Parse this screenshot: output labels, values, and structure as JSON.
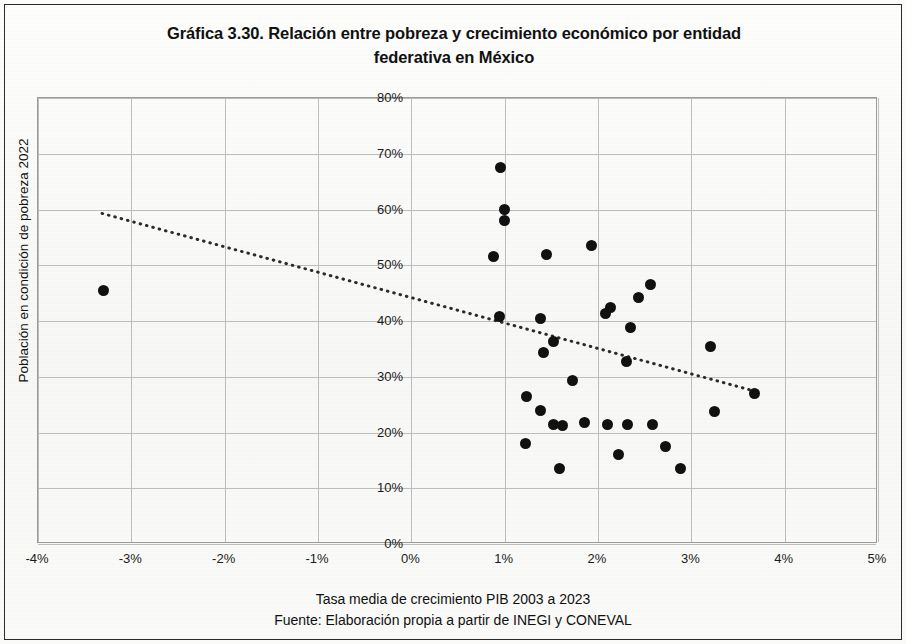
{
  "chart_data": {
    "type": "scatter",
    "title": "Gráfica 3.30. Relación entre pobreza y crecimiento económico por entidad federativa en México",
    "title_line1": "Gráfica 3.30. Relación entre pobreza y crecimiento económico por entidad",
    "title_line2": "federativa en México",
    "xlabel": "Tasa media de crecimiento PIB 2003 a 2023",
    "ylabel": "Población en condición de pobreza 2022",
    "source": "Fuente: Elaboración propia a partir de INEGI y CONEVAL",
    "xlim": [
      -4,
      5
    ],
    "ylim": [
      0,
      80
    ],
    "x_tick_step": 1,
    "y_tick_step": 10,
    "xticks": [
      "-4%",
      "-3%",
      "-2%",
      "-1%",
      "0%",
      "1%",
      "2%",
      "3%",
      "4%",
      "5%"
    ],
    "xtick_values": [
      -4,
      -3,
      -2,
      -1,
      0,
      1,
      2,
      3,
      4,
      5
    ],
    "yticks": [
      "0%",
      "10%",
      "20%",
      "30%",
      "40%",
      "50%",
      "60%",
      "70%",
      "80%"
    ],
    "ytick_values": [
      0,
      10,
      20,
      30,
      40,
      50,
      60,
      70,
      80
    ],
    "grid": true,
    "legend": false,
    "marker_color": "#111111",
    "grid_color": "#bdbdbd",
    "axis_color": "#9a9a9a",
    "marker_size_px": 11,
    "points": [
      {
        "x": -3.3,
        "y": 45.5
      },
      {
        "x": 0.95,
        "y": 67.5
      },
      {
        "x": 1.0,
        "y": 60.0
      },
      {
        "x": 1.0,
        "y": 58.0
      },
      {
        "x": 0.88,
        "y": 51.5
      },
      {
        "x": 1.45,
        "y": 52.0
      },
      {
        "x": 1.93,
        "y": 53.5
      },
      {
        "x": 0.94,
        "y": 40.8
      },
      {
        "x": 1.38,
        "y": 40.5
      },
      {
        "x": 2.08,
        "y": 41.3
      },
      {
        "x": 2.13,
        "y": 42.5
      },
      {
        "x": 2.56,
        "y": 46.5
      },
      {
        "x": 2.43,
        "y": 44.3
      },
      {
        "x": 2.35,
        "y": 38.8
      },
      {
        "x": 1.52,
        "y": 36.3
      },
      {
        "x": 1.42,
        "y": 34.3
      },
      {
        "x": 3.2,
        "y": 35.5
      },
      {
        "x": 2.3,
        "y": 32.8
      },
      {
        "x": 1.73,
        "y": 29.3
      },
      {
        "x": 1.23,
        "y": 26.5
      },
      {
        "x": 1.38,
        "y": 24.0
      },
      {
        "x": 1.52,
        "y": 21.5
      },
      {
        "x": 1.62,
        "y": 21.3
      },
      {
        "x": 1.86,
        "y": 21.8
      },
      {
        "x": 2.1,
        "y": 21.5
      },
      {
        "x": 2.32,
        "y": 21.5
      },
      {
        "x": 2.58,
        "y": 21.5
      },
      {
        "x": 3.25,
        "y": 23.8
      },
      {
        "x": 3.68,
        "y": 27.0
      },
      {
        "x": 1.22,
        "y": 18.0
      },
      {
        "x": 2.22,
        "y": 16.0
      },
      {
        "x": 2.72,
        "y": 17.5
      },
      {
        "x": 1.59,
        "y": 13.5
      },
      {
        "x": 2.88,
        "y": 13.5
      }
    ],
    "trendline": {
      "style": "dotted",
      "color": "#2b2b2b",
      "x_start": -3.32,
      "y_start": 59.2,
      "x_end": 3.7,
      "y_end": 27.2
    }
  }
}
